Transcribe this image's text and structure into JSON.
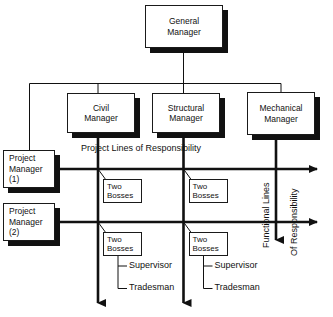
{
  "diagram": {
    "type": "org-chart",
    "colors": {
      "line": "#111111",
      "box_border": "#1a1a1a",
      "box_fill": "#ffffff",
      "shadow": "#111111",
      "background": "#ffffff"
    }
  },
  "nodes": {
    "general_manager": {
      "label": "General\nManager"
    },
    "civil_manager": {
      "label": "Civil\nManager"
    },
    "structural_manager": {
      "label": "Structural\nManager"
    },
    "mechanical_manager": {
      "label": "Mechanical\nManager"
    },
    "project_manager_1": {
      "label": "Project\nManager\n(1)"
    },
    "project_manager_2": {
      "label": "Project\nManager\n(2)"
    },
    "two_bosses_a": {
      "label": "Two\nBosses"
    },
    "two_bosses_b": {
      "label": "Two\nBosses"
    },
    "two_bosses_c": {
      "label": "Two\nBosses"
    },
    "two_bosses_d": {
      "label": "Two\nBosses"
    }
  },
  "leaves": {
    "supervisor_left": "Supervisor",
    "tradesman_left": "Tradesman",
    "supervisor_right": "Supervisor",
    "tradesman_right": "Tradesman"
  },
  "annotations": {
    "project_lines": "Project Lines of Responsibility",
    "functional_lines": "Functional Lines",
    "of_responsibility": "Of Responsibility"
  }
}
